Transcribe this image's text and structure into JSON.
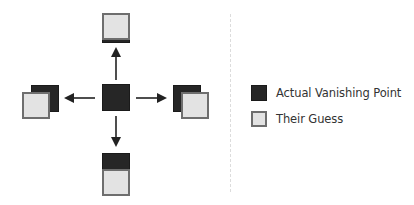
{
  "diagram": {
    "center": {
      "type": "actual"
    },
    "directions": [
      {
        "name": "up",
        "guess_offset": "above, overlapping bottom edge of actual"
      },
      {
        "name": "down",
        "guess_offset": "below, overlapping bottom of actual"
      },
      {
        "name": "left",
        "guess_offset": "left-down, overlapping actual"
      },
      {
        "name": "right",
        "guess_offset": "right-down, overlapping actual"
      }
    ],
    "colors": {
      "actual": "#262626",
      "guess_fill": "#e3e3e3",
      "guess_border": "#6e6e6e",
      "arrow": "#222222"
    }
  },
  "legend": {
    "items": [
      {
        "label": "Actual Vanishing Point",
        "swatch": "dark"
      },
      {
        "label": "Their Guess",
        "swatch": "light"
      }
    ]
  }
}
